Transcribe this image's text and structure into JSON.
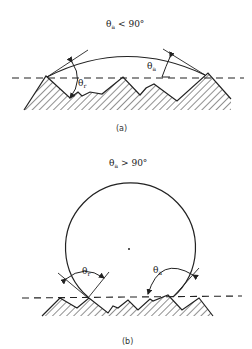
{
  "figure": {
    "panel_a": {
      "title_symbol": "θ",
      "title_subscript": "a",
      "title_relation": "< 90°",
      "label_receding": "θ",
      "label_receding_sub": "r",
      "label_advancing": "θ",
      "label_advancing_sub": "a",
      "caption": "(a)"
    },
    "panel_b": {
      "title_symbol": "θ",
      "title_subscript": "a",
      "title_relation": "> 90°",
      "label_receding": "θ",
      "label_receding_sub": "r",
      "label_advancing": "θ",
      "label_advancing_sub": "a",
      "caption": "(b)"
    }
  }
}
